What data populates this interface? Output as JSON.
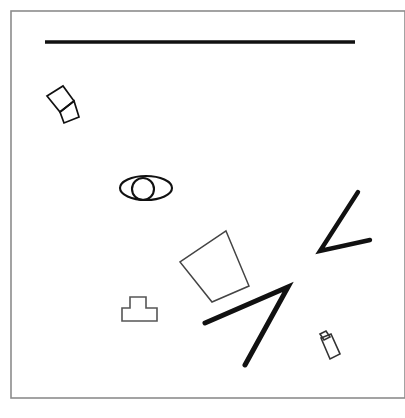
{
  "canvas": {
    "width": 405,
    "height": 418,
    "background_color": "#ffffff",
    "title": "Abstract line-drawing scene"
  },
  "frame": {
    "name": "page-border-frame",
    "x": 11,
    "y": 11,
    "width": 394,
    "height": 387,
    "stroke_color": "#8c8c8c",
    "stroke_width": 1.6,
    "fill": "none"
  },
  "shapes": [
    {
      "id": "horizontal-rule",
      "label": "Horizontal rule",
      "type": "line",
      "points": "45,42 355,42",
      "stroke_color": "#111111",
      "stroke_width": 3.4,
      "fill": "none",
      "linecap": "butt"
    },
    {
      "id": "bowtie-upper-quad",
      "label": "Bowtie upper quadrilateral",
      "type": "polygon",
      "points": "47,96 63,86 74,101 60,112",
      "stroke_color": "#111111",
      "stroke_width": 1.7,
      "fill": "none"
    },
    {
      "id": "bowtie-lower-quad",
      "label": "Bowtie lower quadrilateral",
      "type": "polygon",
      "points": "60,112 74,101 79,117 64,123",
      "stroke_color": "#111111",
      "stroke_width": 1.7,
      "fill": "none"
    },
    {
      "id": "eye-outer-ellipse",
      "label": "Eye outer ellipse",
      "type": "ellipse",
      "cx": 146,
      "cy": 188,
      "rx": 26,
      "ry": 12,
      "stroke_color": "#111111",
      "stroke_width": 2.1,
      "fill": "none"
    },
    {
      "id": "eye-inner-circle",
      "label": "Eye inner circle",
      "type": "ellipse",
      "cx": 143,
      "cy": 189,
      "rx": 11,
      "ry": 11,
      "stroke_color": "#111111",
      "stroke_width": 2.1,
      "fill": "none"
    },
    {
      "id": "center-quadrilateral",
      "label": "Center rotated quadrilateral",
      "type": "polygon",
      "points": "226,231 249,286 212,302 180,262",
      "stroke_color": "#444444",
      "stroke_width": 1.5,
      "fill": "none"
    },
    {
      "id": "tee-polygon",
      "label": "T-shaped polygon",
      "type": "polygon",
      "points": "130,297 146,297 146,308 157,308 157,321 122,321 122,308 130,308",
      "stroke_color": "#555555",
      "stroke_width": 1.6,
      "fill": "none"
    },
    {
      "id": "chevron-right-upper",
      "label": "Upper right chevron stroke",
      "type": "polyline",
      "points": "358,192 320,251 370,240",
      "stroke_color": "#111111",
      "stroke_width": 4.4,
      "fill": "none",
      "linecap": "round",
      "linejoin": "miter"
    },
    {
      "id": "arrow-angle-lower",
      "label": "Lower angular arrow stroke",
      "type": "polyline",
      "points": "205,323 288,287 245,365",
      "stroke_color": "#111111",
      "stroke_width": 5.0,
      "fill": "none",
      "linecap": "round",
      "linejoin": "miter"
    },
    {
      "id": "bottle-body",
      "label": "Bottle body",
      "type": "polygon",
      "points": "321,338 331,334 340,354 330,359",
      "stroke_color": "#333333",
      "stroke_width": 1.6,
      "fill": "none"
    },
    {
      "id": "bottle-cap",
      "label": "Bottle cap",
      "type": "polygon",
      "points": "320,334 326,331 330,337 324,340",
      "stroke_color": "#333333",
      "stroke_width": 1.6,
      "fill": "none"
    }
  ]
}
